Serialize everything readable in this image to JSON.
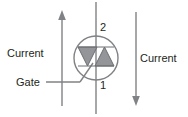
{
  "diagram": {
    "labels": {
      "current_left": "Current",
      "current_right": "Current",
      "gate": "Gate"
    },
    "terminals": {
      "top": "2",
      "bottom": "1"
    },
    "colors": {
      "background": "#ffffff",
      "line": "#808285",
      "triangle_fill": "#939598",
      "triangle_stroke": "#6d6e71",
      "text": "#231f20"
    },
    "arrows": {
      "left_direction": "up",
      "right_direction": "down"
    },
    "icons": {
      "triac": "triac-symbol-icon",
      "arrow_up": "arrow-up-icon",
      "arrow_down": "arrow-down-icon"
    }
  }
}
